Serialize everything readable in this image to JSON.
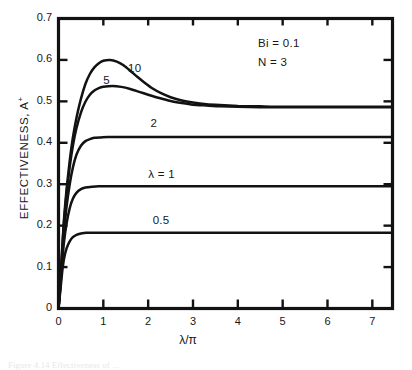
{
  "figure": {
    "caption": "Figure 4.14  Effectiveness of ...",
    "background": "#ffffff",
    "ink_color": "#121212"
  },
  "chart_data": {
    "type": "line",
    "title": "",
    "xlabel": "λ/π",
    "ylabel": "EFFECTIVENESS, A",
    "ylabel_superscript": "+",
    "xlim": [
      0,
      7.45
    ],
    "ylim": [
      0,
      0.7
    ],
    "grid": false,
    "legend": "inline-curve-labels",
    "xticks": [
      0,
      1,
      2,
      3,
      4,
      5,
      6,
      7
    ],
    "xtick_labels": [
      "0",
      "1",
      "2",
      "3",
      "4",
      "5",
      "6",
      "7"
    ],
    "yticks": [
      0,
      0.1,
      0.2,
      0.3,
      0.4,
      0.5,
      0.6,
      0.7
    ],
    "ytick_labels": [
      "0",
      "0.1",
      "0.2",
      "0.3",
      "0.4",
      "0.5",
      "0.6",
      "0.7"
    ],
    "annotations": [
      {
        "name": "biot-number",
        "text": "Bi = 0.1",
        "x": 4.45,
        "y": 0.638
      },
      {
        "name": "n-parameter",
        "text": "N = 3",
        "x": 4.45,
        "y": 0.592
      }
    ],
    "series": [
      {
        "name": "lambda-10",
        "label": "10",
        "label_x": 1.55,
        "label_y": 0.577,
        "plateau": 0.487,
        "peak_x": 1.15,
        "peak_y": 0.6,
        "points": [
          [
            0.0,
            0.0
          ],
          [
            0.04,
            0.062
          ],
          [
            0.08,
            0.14
          ],
          [
            0.12,
            0.212
          ],
          [
            0.18,
            0.288
          ],
          [
            0.25,
            0.356
          ],
          [
            0.32,
            0.412
          ],
          [
            0.4,
            0.46
          ],
          [
            0.5,
            0.506
          ],
          [
            0.6,
            0.542
          ],
          [
            0.7,
            0.566
          ],
          [
            0.8,
            0.582
          ],
          [
            0.9,
            0.592
          ],
          [
            1.0,
            0.598
          ],
          [
            1.15,
            0.6
          ],
          [
            1.3,
            0.596
          ],
          [
            1.45,
            0.587
          ],
          [
            1.6,
            0.574
          ],
          [
            1.75,
            0.56
          ],
          [
            1.9,
            0.547
          ],
          [
            2.1,
            0.531
          ],
          [
            2.3,
            0.519
          ],
          [
            2.5,
            0.51
          ],
          [
            2.75,
            0.502
          ],
          [
            3.0,
            0.497
          ],
          [
            3.3,
            0.493
          ],
          [
            3.6,
            0.491
          ],
          [
            4.0,
            0.489
          ],
          [
            4.5,
            0.488
          ],
          [
            5.0,
            0.487
          ],
          [
            6.0,
            0.487
          ],
          [
            7.0,
            0.487
          ],
          [
            7.45,
            0.487
          ]
        ]
      },
      {
        "name": "lambda-5",
        "label": "5",
        "label_x": 1.0,
        "label_y": 0.549,
        "plateau": 0.486,
        "peak_x": 1.2,
        "peak_y": 0.537,
        "points": [
          [
            0.0,
            0.0
          ],
          [
            0.04,
            0.06
          ],
          [
            0.08,
            0.136
          ],
          [
            0.12,
            0.205
          ],
          [
            0.18,
            0.278
          ],
          [
            0.25,
            0.342
          ],
          [
            0.32,
            0.392
          ],
          [
            0.4,
            0.435
          ],
          [
            0.5,
            0.473
          ],
          [
            0.6,
            0.499
          ],
          [
            0.7,
            0.516
          ],
          [
            0.8,
            0.526
          ],
          [
            0.9,
            0.532
          ],
          [
            1.0,
            0.535
          ],
          [
            1.2,
            0.537
          ],
          [
            1.4,
            0.535
          ],
          [
            1.6,
            0.53
          ],
          [
            1.8,
            0.523
          ],
          [
            2.0,
            0.516
          ],
          [
            2.25,
            0.508
          ],
          [
            2.5,
            0.501
          ],
          [
            2.75,
            0.496
          ],
          [
            3.0,
            0.492
          ],
          [
            3.3,
            0.49
          ],
          [
            3.6,
            0.488
          ],
          [
            4.0,
            0.487
          ],
          [
            4.5,
            0.486
          ],
          [
            5.0,
            0.486
          ],
          [
            6.0,
            0.486
          ],
          [
            7.0,
            0.486
          ],
          [
            7.45,
            0.486
          ]
        ]
      },
      {
        "name": "lambda-2",
        "label": "2",
        "label_x": 2.05,
        "label_y": 0.444,
        "plateau": 0.414,
        "points": [
          [
            0.0,
            0.0
          ],
          [
            0.04,
            0.055
          ],
          [
            0.08,
            0.122
          ],
          [
            0.12,
            0.182
          ],
          [
            0.18,
            0.246
          ],
          [
            0.25,
            0.3
          ],
          [
            0.32,
            0.34
          ],
          [
            0.4,
            0.371
          ],
          [
            0.5,
            0.393
          ],
          [
            0.6,
            0.404
          ],
          [
            0.7,
            0.409
          ],
          [
            0.8,
            0.412
          ],
          [
            0.95,
            0.413
          ],
          [
            1.1,
            0.414
          ],
          [
            1.4,
            0.414
          ],
          [
            2.0,
            0.414
          ],
          [
            3.0,
            0.414
          ],
          [
            4.0,
            0.414
          ],
          [
            5.0,
            0.414
          ],
          [
            6.0,
            0.414
          ],
          [
            7.0,
            0.414
          ],
          [
            7.45,
            0.414
          ]
        ]
      },
      {
        "name": "lambda-1",
        "label": "λ = 1",
        "label_x": 2.0,
        "label_y": 0.322,
        "plateau": 0.295,
        "points": [
          [
            0.0,
            0.0
          ],
          [
            0.04,
            0.05
          ],
          [
            0.08,
            0.108
          ],
          [
            0.12,
            0.158
          ],
          [
            0.18,
            0.205
          ],
          [
            0.25,
            0.242
          ],
          [
            0.32,
            0.265
          ],
          [
            0.4,
            0.279
          ],
          [
            0.5,
            0.288
          ],
          [
            0.6,
            0.292
          ],
          [
            0.75,
            0.294
          ],
          [
            0.9,
            0.295
          ],
          [
            1.2,
            0.295
          ],
          [
            2.0,
            0.295
          ],
          [
            3.0,
            0.295
          ],
          [
            4.0,
            0.295
          ],
          [
            5.0,
            0.295
          ],
          [
            6.0,
            0.295
          ],
          [
            7.0,
            0.295
          ],
          [
            7.45,
            0.295
          ]
        ]
      },
      {
        "name": "lambda-0-5",
        "label": "0.5",
        "label_x": 2.1,
        "label_y": 0.211,
        "plateau": 0.183,
        "points": [
          [
            0.0,
            0.0
          ],
          [
            0.04,
            0.042
          ],
          [
            0.08,
            0.086
          ],
          [
            0.12,
            0.118
          ],
          [
            0.18,
            0.145
          ],
          [
            0.25,
            0.162
          ],
          [
            0.32,
            0.172
          ],
          [
            0.4,
            0.178
          ],
          [
            0.5,
            0.181
          ],
          [
            0.62,
            0.183
          ],
          [
            0.8,
            0.183
          ],
          [
            1.0,
            0.183
          ],
          [
            2.0,
            0.183
          ],
          [
            3.0,
            0.183
          ],
          [
            4.0,
            0.183
          ],
          [
            5.0,
            0.183
          ],
          [
            6.0,
            0.183
          ],
          [
            7.0,
            0.183
          ],
          [
            7.45,
            0.183
          ]
        ]
      }
    ]
  }
}
